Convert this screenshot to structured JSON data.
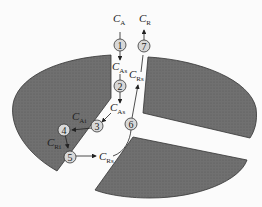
{
  "diagram": {
    "type": "catalyst pellet reaction steps",
    "steps": [
      {
        "id": "1",
        "label": "1"
      },
      {
        "id": "2",
        "label": "2"
      },
      {
        "id": "3",
        "label": "3"
      },
      {
        "id": "4",
        "label": "4"
      },
      {
        "id": "5",
        "label": "5"
      },
      {
        "id": "6",
        "label": "6"
      },
      {
        "id": "7",
        "label": "7"
      }
    ],
    "labels": {
      "CA": {
        "main": "C",
        "sub": "A"
      },
      "CAs_top": {
        "main": "C",
        "sub": "As"
      },
      "CAs_mid": {
        "main": "C",
        "sub": "As"
      },
      "CAi": {
        "main": "C",
        "sub": "Ai"
      },
      "CRi": {
        "main": "C",
        "sub": "Ri"
      },
      "CRs_bottom": {
        "main": "C",
        "sub": "Rs"
      },
      "CRs_top": {
        "main": "C",
        "sub": "Rs"
      },
      "CR": {
        "main": "C",
        "sub": "R"
      }
    },
    "colors": {
      "solid": "#6e6e6e",
      "edge": "#333333",
      "circle": "#d8d8d8"
    }
  }
}
